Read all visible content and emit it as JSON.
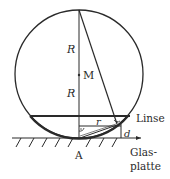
{
  "diagram": {
    "type": "geometry",
    "labels": {
      "R_upper": "R",
      "M": "M",
      "R_lower": "R",
      "r": "r",
      "d": "d",
      "lens": "Linse",
      "A": "A",
      "glass_line1": "Glas-",
      "glass_line2": "platte"
    },
    "colors": {
      "stroke": "#2a2a2a",
      "background": "#ffffff"
    }
  }
}
